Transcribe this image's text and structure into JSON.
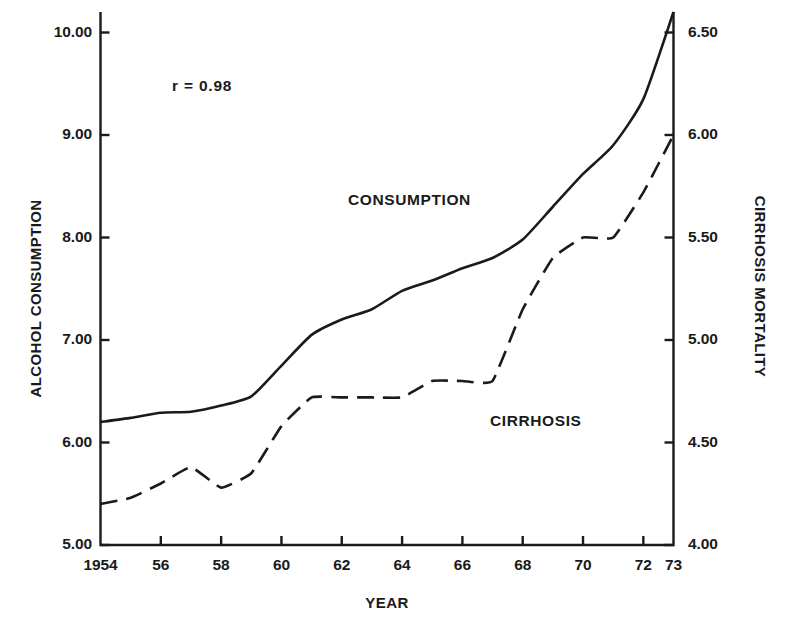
{
  "chart_data": {
    "type": "line",
    "title": "",
    "xlabel": "YEAR",
    "ylabel": "ALCOHOL CONSUMPTION",
    "ylabel_right": "CIRRHOSIS MORTALITY",
    "annotation": "r = 0.98",
    "grid": false,
    "legend_position": "inline-labels",
    "xlim": [
      1954,
      1973
    ],
    "ylim": [
      5.0,
      10.2
    ],
    "ylim_right": [
      4.0,
      6.6
    ],
    "x_tick_labels": [
      "1954",
      "56",
      "58",
      "60",
      "62",
      "64",
      "66",
      "68",
      "70",
      "72",
      "73"
    ],
    "x_tick_values": [
      1954,
      1956,
      1958,
      1960,
      1962,
      1964,
      1966,
      1968,
      1970,
      1972,
      1973
    ],
    "y_tick_labels_left": [
      "10.00",
      "9.00",
      "8.00",
      "7.00",
      "6.00",
      "5.00"
    ],
    "y_tick_values_left": [
      10.0,
      9.0,
      8.0,
      7.0,
      6.0,
      5.0
    ],
    "y_tick_labels_right": [
      "6.50",
      "6.00",
      "5.50",
      "5.00",
      "4.50",
      "4.00"
    ],
    "y_tick_values_right": [
      6.5,
      6.0,
      5.5,
      5.0,
      4.5,
      4.0
    ],
    "x": [
      1954,
      1955,
      1956,
      1957,
      1958,
      1959,
      1960,
      1961,
      1962,
      1963,
      1964,
      1965,
      1966,
      1967,
      1968,
      1969,
      1970,
      1971,
      1972,
      1973
    ],
    "series": [
      {
        "name": "CONSUMPTION",
        "axis": "left",
        "style": "solid",
        "values": [
          6.2,
          6.24,
          6.29,
          6.3,
          6.36,
          6.45,
          6.75,
          7.05,
          7.2,
          7.3,
          7.48,
          7.58,
          7.7,
          7.8,
          7.98,
          8.3,
          8.62,
          8.9,
          9.35,
          10.2
        ]
      },
      {
        "name": "CIRRHOSIS",
        "axis": "right",
        "style": "dashed",
        "values": [
          4.2,
          4.23,
          4.3,
          4.38,
          4.28,
          4.35,
          4.58,
          4.72,
          4.72,
          4.72,
          4.72,
          4.8,
          4.8,
          4.8,
          5.15,
          5.4,
          5.5,
          5.5,
          5.72,
          6.0
        ]
      }
    ]
  }
}
